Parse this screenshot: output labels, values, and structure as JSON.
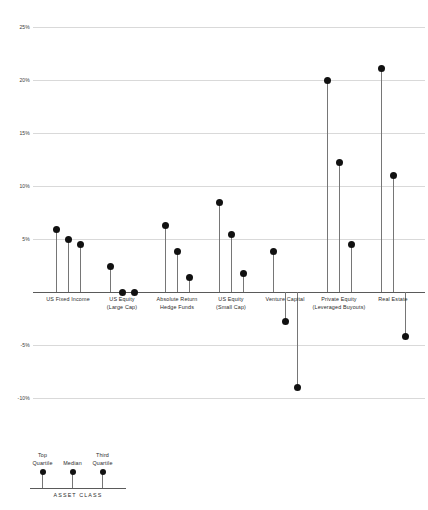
{
  "chart_data": {
    "type": "scatter",
    "title": "",
    "subtitle": "",
    "xlabel": "ASSET CLASS",
    "ylabel": "",
    "ylim": [
      -12,
      26
    ],
    "grid": true,
    "legend_position": "bottom-left",
    "ytick_labels": [
      "25%",
      "20%",
      "15%",
      "10%",
      "5%",
      "-5%",
      "-10%"
    ],
    "ytick_values": [
      25,
      20,
      15,
      10,
      5,
      -5,
      -10
    ],
    "categories": [
      "US Fixed Income",
      "US Equity (Large Cap)",
      "Absolute Return Hedge Funds",
      "US Equity (Small Cap)",
      "Venture Capital",
      "Private Equity (Leveraged Buyouts)",
      "Real Estate"
    ],
    "category_label_lines": [
      [
        "US Fixed Income",
        ""
      ],
      [
        "US Equity",
        "(Large Cap)"
      ],
      [
        "Absolute Return",
        "Hedge Funds"
      ],
      [
        "US Equity",
        "(Small Cap)"
      ],
      [
        "Venture Capital",
        ""
      ],
      [
        "Private Equity",
        "(Leveraged Buyouts)"
      ],
      [
        "Real Estate",
        ""
      ]
    ],
    "series": [
      {
        "name": "Top Quartile",
        "values": [
          5.9,
          2.4,
          6.3,
          8.4,
          3.8,
          20.0,
          21.1
        ]
      },
      {
        "name": "Median",
        "values": [
          5.0,
          0.0,
          3.8,
          5.4,
          -2.8,
          12.2,
          11.0
        ]
      },
      {
        "name": "Third Quartile",
        "values": [
          4.5,
          0.0,
          1.4,
          1.7,
          -9.0,
          4.5,
          -4.2
        ]
      }
    ],
    "legend_entries": [
      {
        "label_lines": [
          "Top",
          "Quartile"
        ]
      },
      {
        "label_lines": [
          "",
          "Median"
        ]
      },
      {
        "label_lines": [
          "Third",
          "Quartile"
        ]
      }
    ],
    "colors": {
      "dot": "#111111",
      "stem": "#767676",
      "grid": "#d9d9d9",
      "axis": "#5a5a5a",
      "text": "#2b2b2b",
      "background": "#ffffff"
    }
  }
}
